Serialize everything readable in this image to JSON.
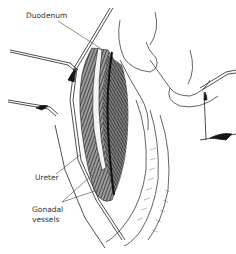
{
  "figure": {
    "type": "anatomical line illustration",
    "labels": {
      "duodenum": "Duodenum",
      "ureter": "Ureter",
      "gonadal_line1": "Gonadal",
      "gonadal_line2": "vessels"
    },
    "colors": {
      "ink": "#1a1a1a",
      "label_text": "#333333",
      "hatch": "#3a3a3a",
      "background": "#ffffff"
    }
  }
}
